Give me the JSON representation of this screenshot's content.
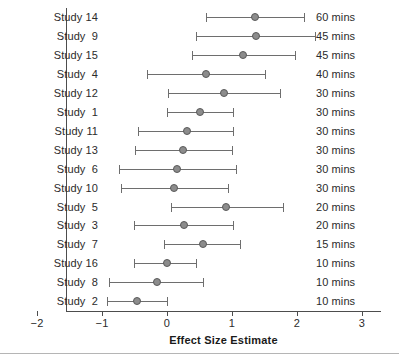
{
  "chart_data": {
    "type": "scatter",
    "plot_kind": "forest-plot",
    "title": "",
    "xlabel": "Effect Size Estimate",
    "ylabel": "",
    "xlim": [
      -2,
      3
    ],
    "xticks": [
      -2,
      -1,
      0,
      1,
      2,
      3
    ],
    "xtick_labels": [
      "−2",
      "−1",
      "0",
      "1",
      "2",
      "3"
    ],
    "grid": false,
    "legend": "none",
    "right_axis_label": "Session duration",
    "marker_color": "#8c8c8c",
    "marker_edge_color": "#5a5a5a",
    "line_color": "#6e6e6e",
    "axis_color": "#4d4d4d",
    "categories": [
      "Study 14",
      "Study  9",
      "Study 15",
      "Study  4",
      "Study 12",
      "Study  1",
      "Study 11",
      "Study 13",
      "Study  6",
      "Study 10",
      "Study  5",
      "Study  3",
      "Study  7",
      "Study 16",
      "Study  8",
      "Study  2"
    ],
    "rows": [
      {
        "study": "Study 14",
        "estimate": 1.35,
        "ci_low": 0.6,
        "ci_high": 2.1,
        "duration": "60 mins"
      },
      {
        "study": "Study  9",
        "estimate": 1.37,
        "ci_low": 0.45,
        "ci_high": 2.28,
        "duration": "45 mins"
      },
      {
        "study": "Study 15",
        "estimate": 1.17,
        "ci_low": 0.38,
        "ci_high": 1.97,
        "duration": "45 mins"
      },
      {
        "study": "Study  4",
        "estimate": 0.6,
        "ci_low": -0.31,
        "ci_high": 1.51,
        "duration": "40 mins"
      },
      {
        "study": "Study 12",
        "estimate": 0.88,
        "ci_low": 0.02,
        "ci_high": 1.74,
        "duration": "30 mins"
      },
      {
        "study": "Study  1",
        "estimate": 0.51,
        "ci_low": 0.0,
        "ci_high": 1.02,
        "duration": "30 mins"
      },
      {
        "study": "Study 11",
        "estimate": 0.31,
        "ci_low": -0.45,
        "ci_high": 1.02,
        "duration": "30 mins"
      },
      {
        "study": "Study 13",
        "estimate": 0.25,
        "ci_low": -0.49,
        "ci_high": 1.0,
        "duration": "30 mins"
      },
      {
        "study": "Study  6",
        "estimate": 0.15,
        "ci_low": -0.74,
        "ci_high": 1.06,
        "duration": "30 mins"
      },
      {
        "study": "Study 10",
        "estimate": 0.11,
        "ci_low": -0.71,
        "ci_high": 0.94,
        "duration": "30 mins"
      },
      {
        "study": "Study  5",
        "estimate": 0.91,
        "ci_low": 0.06,
        "ci_high": 1.78,
        "duration": "20 mins"
      },
      {
        "study": "Study  3",
        "estimate": 0.26,
        "ci_low": -0.51,
        "ci_high": 1.02,
        "duration": "20 mins"
      },
      {
        "study": "Study  7",
        "estimate": 0.55,
        "ci_low": -0.05,
        "ci_high": 1.12,
        "duration": "15 mins"
      },
      {
        "study": "Study 16",
        "estimate": 0.0,
        "ci_low": -0.51,
        "ci_high": 0.45,
        "duration": "10 mins"
      },
      {
        "study": "Study  8",
        "estimate": -0.16,
        "ci_low": -0.89,
        "ci_high": 0.55,
        "duration": "10 mins"
      },
      {
        "study": "Study  2",
        "estimate": -0.46,
        "ci_low": -0.92,
        "ci_high": 0.0,
        "duration": "10 mins"
      }
    ]
  }
}
